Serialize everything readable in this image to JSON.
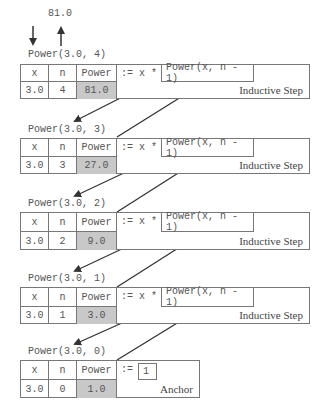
{
  "top": {
    "result_value": "81.0",
    "call_label": "Power(3.0, 4)"
  },
  "headers": {
    "x": "x",
    "n": "n",
    "power": "Power",
    "assign_recursive": ":= x *",
    "assign_anchor": ":="
  },
  "frames": [
    {
      "call_label": "Power(3.0, 4)",
      "x": "3.0",
      "n": "4",
      "power": "81.0",
      "expression": "Power(x, n - 1)",
      "kind": "Inductive Step"
    },
    {
      "call_label": "Power(3.0, 3)",
      "x": "3.0",
      "n": "3",
      "power": "27.0",
      "expression": "Power(x, n - 1)",
      "kind": "Inductive Step"
    },
    {
      "call_label": "Power(3.0, 2)",
      "x": "3.0",
      "n": "2",
      "power": "9.0",
      "expression": "Power(x, n - 1)",
      "kind": "Inductive Step"
    },
    {
      "call_label": "Power(3.0, 1)",
      "x": "3.0",
      "n": "1",
      "power": "3.0",
      "expression": "Power(x, n - 1)",
      "kind": "Inductive Step"
    },
    {
      "call_label": "Power(3.0, 0)",
      "x": "3.0",
      "n": "0",
      "power": "1.0",
      "expression": "1",
      "kind": "Anchor"
    }
  ],
  "colors": {
    "line": "#777777",
    "shaded": "#c8c8c8",
    "arrow": "#333333"
  }
}
